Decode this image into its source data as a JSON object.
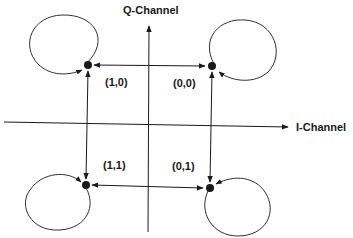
{
  "diagram": {
    "type": "QPSK constellation state diagram",
    "axes": {
      "vertical_label": "Q-Channel",
      "horizontal_label": "I-Channel"
    },
    "states": [
      {
        "label": "(1,0)",
        "quadrant": "top-left"
      },
      {
        "label": "(0,0)",
        "quadrant": "top-right"
      },
      {
        "label": "(1,1)",
        "quadrant": "bottom-left"
      },
      {
        "label": "(0,1)",
        "quadrant": "bottom-right"
      }
    ],
    "transitions": [
      {
        "from": "(1,0)",
        "to": "(0,0)",
        "direction": "bidirectional"
      },
      {
        "from": "(1,1)",
        "to": "(0,1)",
        "direction": "bidirectional"
      },
      {
        "from": "(1,0)",
        "to": "(1,1)",
        "direction": "bidirectional"
      },
      {
        "from": "(0,0)",
        "to": "(0,1)",
        "direction": "bidirectional"
      },
      {
        "from": "(1,0)",
        "to": "(1,0)",
        "direction": "self-loop"
      },
      {
        "from": "(0,0)",
        "to": "(0,0)",
        "direction": "self-loop"
      },
      {
        "from": "(1,1)",
        "to": "(1,1)",
        "direction": "self-loop"
      },
      {
        "from": "(0,1)",
        "to": "(0,1)",
        "direction": "self-loop"
      }
    ],
    "colors": {
      "ink": "#1a1a1a",
      "background": "#ffffff"
    }
  }
}
